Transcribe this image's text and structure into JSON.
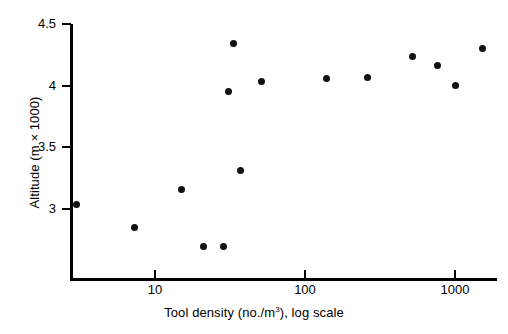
{
  "chart_data": {
    "type": "scatter",
    "title": "",
    "xlabel": "Tool density (no./m3), log scale",
    "xlabel_parts": {
      "pre": "Tool density (no./m",
      "sup": "3",
      "post": "), log scale"
    },
    "ylabel": "Altitude (m × 1000)",
    "xscale": "log",
    "yscale": "linear",
    "xlim": [
      2.4,
      1900
    ],
    "ylim": [
      2.62,
      4.5
    ],
    "grid": false,
    "legend": null,
    "xticks": [
      10,
      100,
      1000
    ],
    "xtick_labels": [
      "10",
      "100",
      "1000"
    ],
    "yticks": [
      3,
      3.5,
      4,
      4.5
    ],
    "ytick_labels": [
      "3",
      "3.5",
      "4",
      "4.5"
    ],
    "marker": "filled-circle",
    "marker_color": "#111111",
    "axis_color": "#000000",
    "points": [
      {
        "x": 3.0,
        "y": 3.04
      },
      {
        "x": 7.3,
        "y": 2.85
      },
      {
        "x": 15.0,
        "y": 3.16
      },
      {
        "x": 21.0,
        "y": 2.7
      },
      {
        "x": 28.5,
        "y": 2.7
      },
      {
        "x": 31.0,
        "y": 3.95
      },
      {
        "x": 33.5,
        "y": 4.34
      },
      {
        "x": 37.0,
        "y": 3.31
      },
      {
        "x": 51.0,
        "y": 4.03
      },
      {
        "x": 140.0,
        "y": 4.06
      },
      {
        "x": 260.0,
        "y": 4.07
      },
      {
        "x": 520.0,
        "y": 4.24
      },
      {
        "x": 760.0,
        "y": 4.16
      },
      {
        "x": 1010.0,
        "y": 4.0
      },
      {
        "x": 1520.0,
        "y": 4.3
      }
    ]
  },
  "axes": {
    "x_tick_labels": [
      "10",
      "100",
      "1000"
    ],
    "y_tick_labels": [
      "4.5",
      "4",
      "3.5",
      "3"
    ]
  }
}
